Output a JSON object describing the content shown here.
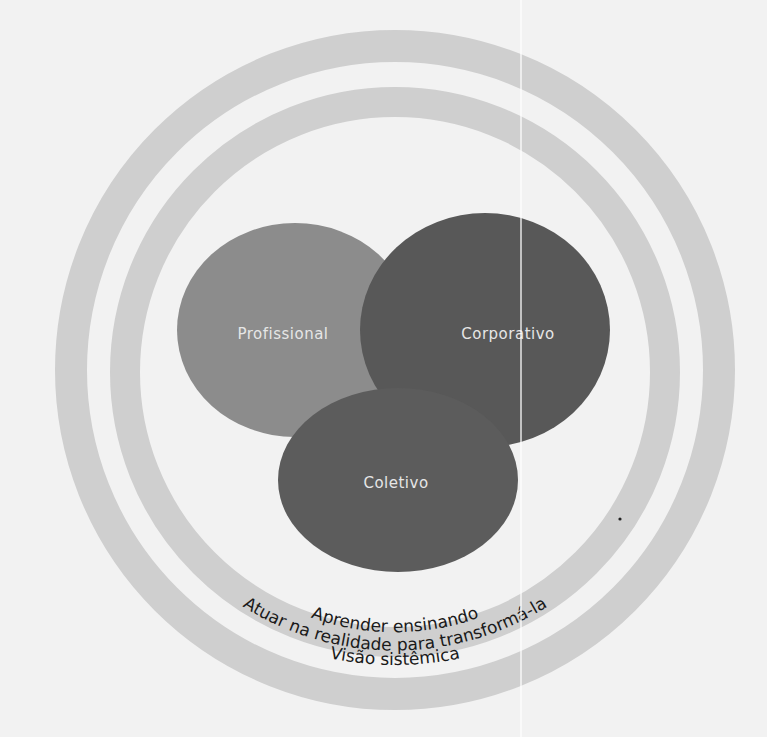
{
  "diagram": {
    "type": "venn-with-concentric-rings",
    "circles": [
      {
        "id": "profissional",
        "label": "Profissional",
        "color": "#8c8c8c"
      },
      {
        "id": "corporativo",
        "label": "Corporativo",
        "color": "#555555"
      },
      {
        "id": "coletivo",
        "label": "Coletivo",
        "color": "#5a5a5a"
      }
    ],
    "rings": [
      {
        "id": "inner",
        "label": "Aprender ensinando",
        "color": "#cfcfcf"
      },
      {
        "id": "middle-gap",
        "label": "Atuar na realidade para transformá-la",
        "color": "#f2f2f2"
      },
      {
        "id": "outer",
        "label": "Visão sistêmica",
        "color": "#cfcfcf"
      }
    ],
    "background": "#f2f2f2"
  }
}
